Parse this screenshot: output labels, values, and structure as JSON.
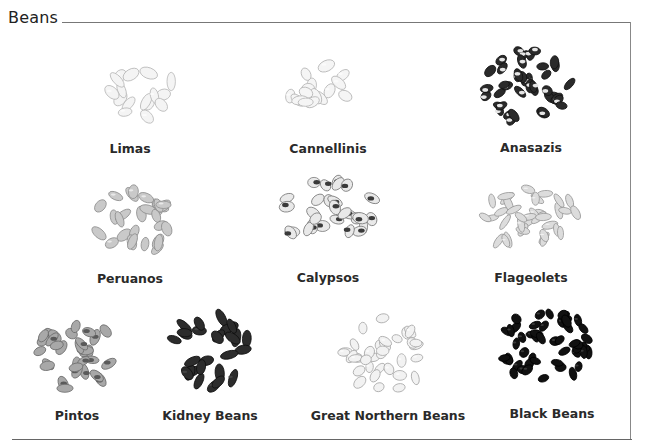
{
  "title": "Beans",
  "beans": [
    {
      "name": "Limas",
      "label_x": 130,
      "label_y": 141,
      "pile": {
        "cx": 140,
        "cy": 92,
        "rx": 42,
        "ry": 30,
        "fill": "#f4f4f4",
        "stroke": "#b8b8b8",
        "bw": 17,
        "bh": 10,
        "seed": 3,
        "speckle": null
      }
    },
    {
      "name": "Cannellinis",
      "label_x": 328,
      "label_y": 141,
      "pile": {
        "cx": 323,
        "cy": 88,
        "rx": 42,
        "ry": 28,
        "fill": "#f5f5f5",
        "stroke": "#b5b5b5",
        "bw": 16,
        "bh": 10,
        "seed": 7,
        "speckle": null
      }
    },
    {
      "name": "Anasazis",
      "label_x": 531,
      "label_y": 140,
      "pile": {
        "cx": 527,
        "cy": 86,
        "rx": 48,
        "ry": 40,
        "fill": "#2a2a2a",
        "stroke": "#111111",
        "bw": 13,
        "bh": 8,
        "seed": 11,
        "speckle": "#e6e6e6"
      }
    },
    {
      "name": "Peruanos",
      "label_x": 130,
      "label_y": 271,
      "pile": {
        "cx": 133,
        "cy": 222,
        "rx": 50,
        "ry": 36,
        "fill": "#c9c9c9",
        "stroke": "#8f8f8f",
        "bw": 16,
        "bh": 9,
        "seed": 5,
        "speckle": null
      }
    },
    {
      "name": "Calypsos",
      "label_x": 328,
      "label_y": 270,
      "pile": {
        "cx": 328,
        "cy": 212,
        "rx": 55,
        "ry": 36,
        "fill": "#e9e9e9",
        "stroke": "#7a7a7a",
        "bw": 15,
        "bh": 10,
        "seed": 13,
        "speckle": "#3a3a3a"
      }
    },
    {
      "name": "Flageolets",
      "label_x": 531,
      "label_y": 270,
      "pile": {
        "cx": 530,
        "cy": 218,
        "rx": 55,
        "ry": 34,
        "fill": "#dcdcdc",
        "stroke": "#9a9a9a",
        "bw": 16,
        "bh": 7,
        "seed": 17,
        "speckle": null
      }
    },
    {
      "name": "Pintos",
      "label_x": 77,
      "label_y": 408,
      "pile": {
        "cx": 77,
        "cy": 352,
        "rx": 45,
        "ry": 42,
        "fill": "#a8a8a8",
        "stroke": "#6d6d6d",
        "bw": 15,
        "bh": 9,
        "seed": 19,
        "speckle": "#5a5a5a"
      }
    },
    {
      "name": "Kidney Beans",
      "label_x": 210,
      "label_y": 408,
      "pile": {
        "cx": 212,
        "cy": 352,
        "rx": 48,
        "ry": 40,
        "fill": "#2c2c2c",
        "stroke": "#0f0f0f",
        "bw": 17,
        "bh": 9,
        "seed": 23,
        "speckle": null
      }
    },
    {
      "name": "Great Northern Beans",
      "label_x": 388,
      "label_y": 408,
      "pile": {
        "cx": 385,
        "cy": 354,
        "rx": 47,
        "ry": 40,
        "fill": "#f2f2f2",
        "stroke": "#a8a8a8",
        "bw": 13,
        "bh": 9,
        "seed": 29,
        "speckle": null
      }
    },
    {
      "name": "Black Beans",
      "label_x": 552,
      "label_y": 406,
      "pile": {
        "cx": 547,
        "cy": 347,
        "rx": 52,
        "ry": 42,
        "fill": "#111111",
        "stroke": "#000000",
        "bw": 12,
        "bh": 8,
        "seed": 31,
        "speckle": null
      }
    }
  ]
}
